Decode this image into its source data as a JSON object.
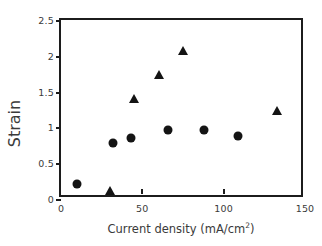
{
  "chart_data": {
    "type": "scatter",
    "title": "",
    "xlabel": "Current density (mA/cm²)",
    "xlabel_base": "Current density (mA/cm",
    "xlabel_sup": "2",
    "xlabel_tail": ")",
    "ylabel": "Strain",
    "xlim": [
      0,
      150
    ],
    "ylim": [
      0,
      2.5
    ],
    "xticks": [
      0,
      50,
      100,
      150
    ],
    "xtick_labels": [
      "0",
      "50",
      "100",
      "150"
    ],
    "yticks": [
      0,
      0.5,
      1,
      1.5,
      2,
      2.5
    ],
    "ytick_labels": [
      "0",
      "0.5",
      "1",
      "1.5",
      "2",
      "2.5"
    ],
    "grid": false,
    "legend": false,
    "legend_position": "none",
    "marker_color": "#141414",
    "axis_color": "#1c1c1c",
    "background": "#ffffff",
    "series": [
      {
        "name": "circle-series",
        "marker": "circle",
        "points": [
          {
            "x": 10,
            "y": 0.21
          },
          {
            "x": 32,
            "y": 0.78
          },
          {
            "x": 43,
            "y": 0.85
          },
          {
            "x": 66,
            "y": 0.97
          },
          {
            "x": 88,
            "y": 0.97
          },
          {
            "x": 109,
            "y": 0.88
          }
        ]
      },
      {
        "name": "triangle-series",
        "marker": "triangle",
        "points": [
          {
            "x": 30,
            "y": 0.11
          },
          {
            "x": 45,
            "y": 1.39
          },
          {
            "x": 60,
            "y": 1.73
          },
          {
            "x": 75,
            "y": 2.07
          },
          {
            "x": 133,
            "y": 1.23
          }
        ]
      }
    ]
  }
}
